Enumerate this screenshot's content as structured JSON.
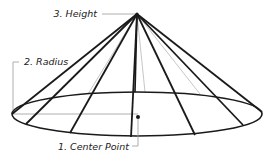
{
  "diagram": {
    "labels": {
      "center_point": "1. Center Point",
      "radius": "2. Radius",
      "height": "3. Height"
    },
    "colors": {
      "edge": "#1a1a1a",
      "hidden_edge": "#b0b0b0",
      "leader": "#9a9a9a",
      "text": "#222222"
    }
  }
}
